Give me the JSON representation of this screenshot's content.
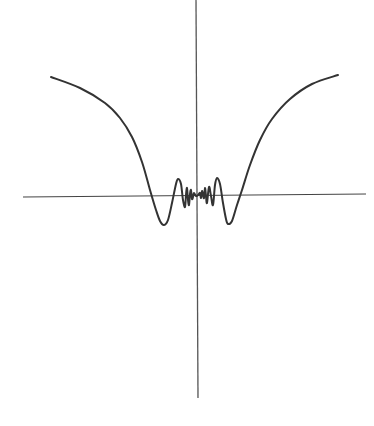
{
  "chart_data": {
    "type": "line",
    "title": "",
    "xlabel": "",
    "ylabel": "",
    "grid": false,
    "legend": null,
    "axes": {
      "x_axis": {
        "x1": 23,
        "y1": 197,
        "x2": 366,
        "y2": 194
      },
      "y_axis": {
        "x1": 196,
        "y1": 0,
        "x2": 198,
        "y2": 398
      }
    },
    "series": [
      {
        "name": "curve",
        "color": "#333333",
        "points_px": [
          [
            51,
            77
          ],
          [
            80,
            88
          ],
          [
            105,
            103
          ],
          [
            120,
            118
          ],
          [
            132,
            137
          ],
          [
            142,
            162
          ],
          [
            150,
            190
          ],
          [
            156,
            210
          ],
          [
            160,
            221
          ],
          [
            164,
            225
          ],
          [
            168,
            220
          ],
          [
            172,
            203
          ],
          [
            176,
            184
          ],
          [
            178,
            179
          ],
          [
            181,
            184
          ],
          [
            183,
            200
          ],
          [
            185,
            207
          ],
          [
            186,
            195
          ],
          [
            187,
            188
          ],
          [
            188,
            200
          ],
          [
            189,
            205
          ],
          [
            190,
            194
          ],
          [
            191,
            190
          ],
          [
            192,
            199
          ],
          [
            193,
            197
          ],
          [
            194,
            193
          ],
          [
            196,
            196
          ],
          [
            198,
            195
          ],
          [
            200,
            193
          ],
          [
            201,
            198
          ],
          [
            202,
            191
          ],
          [
            203,
            195
          ],
          [
            204,
            198
          ],
          [
            205,
            188
          ],
          [
            206,
            196
          ],
          [
            207,
            203
          ],
          [
            209,
            187
          ],
          [
            211,
            196
          ],
          [
            213,
            205
          ],
          [
            215,
            185
          ],
          [
            217,
            178
          ],
          [
            220,
            184
          ],
          [
            223,
            203
          ],
          [
            226,
            219
          ],
          [
            228,
            224
          ],
          [
            232,
            221
          ],
          [
            237,
            205
          ],
          [
            242,
            190
          ],
          [
            250,
            165
          ],
          [
            260,
            140
          ],
          [
            272,
            119
          ],
          [
            290,
            99
          ],
          [
            312,
            84
          ],
          [
            338,
            75
          ]
        ]
      }
    ],
    "stroke": "#333333"
  }
}
